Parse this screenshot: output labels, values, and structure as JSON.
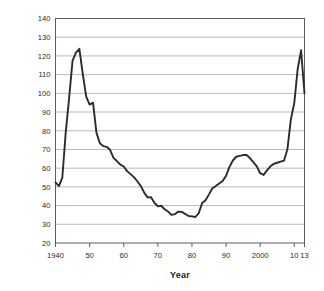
{
  "chart_data": {
    "type": "line",
    "title": "",
    "xlabel": "Year",
    "ylabel": "Federal debt as percentage of GDP",
    "xlim": [
      1940,
      2013
    ],
    "ylim": [
      20,
      140
    ],
    "grid": true,
    "legend": "none",
    "y_ticks": [
      140,
      130,
      120,
      110,
      100,
      90,
      80,
      70,
      60,
      50,
      40,
      30,
      20
    ],
    "y_tick_labels": [
      "140",
      "130",
      "120",
      "110",
      "100",
      "90",
      "80",
      "70",
      "60",
      "50",
      "40",
      "30",
      "20"
    ],
    "x_ticks": [
      1940,
      1950,
      1960,
      1970,
      1980,
      1990,
      2000,
      2010,
      2013
    ],
    "x_tick_labels": [
      "1940",
      "50",
      "60",
      "70",
      "80",
      "90",
      "2000",
      "10",
      "13"
    ],
    "line_color": "#2b2b2b",
    "grid_color": "#8c8c8c",
    "axis_color": "#4d4d4d",
    "series": [
      {
        "name": "Federal debt held as percentage of GDP",
        "x": [
          1940,
          1941,
          1942,
          1943,
          1944,
          1945,
          1946,
          1947,
          1948,
          1949,
          1950,
          1951,
          1952,
          1953,
          1954,
          1955,
          1956,
          1957,
          1958,
          1959,
          1960,
          1961,
          1962,
          1963,
          1964,
          1965,
          1966,
          1967,
          1968,
          1969,
          1970,
          1971,
          1972,
          1973,
          1974,
          1975,
          1976,
          1977,
          1978,
          1979,
          1980,
          1981,
          1982,
          1983,
          1984,
          1985,
          1986,
          1987,
          1988,
          1989,
          1990,
          1991,
          1992,
          1993,
          1994,
          1995,
          1996,
          1997,
          1998,
          1999,
          2000,
          2001,
          2002,
          2003,
          2004,
          2005,
          2006,
          2007,
          2008,
          2009,
          2010,
          2011,
          2012,
          2013
        ],
        "values": [
          52.4,
          50.4,
          54.9,
          79.1,
          97.6,
          117.5,
          121.7,
          123.8,
          110.3,
          98.2,
          94.0,
          95.0,
          79.0,
          73.3,
          71.8,
          71.4,
          69.8,
          65.5,
          63.8,
          61.9,
          60.9,
          58.4,
          56.8,
          55.2,
          53.0,
          50.5,
          46.9,
          44.4,
          44.5,
          41.5,
          39.6,
          39.9,
          38.0,
          36.8,
          35.0,
          35.4,
          36.8,
          36.6,
          35.6,
          34.4,
          34.2,
          33.9,
          36.0,
          41.4,
          42.9,
          46.0,
          49.3,
          50.5,
          51.8,
          53.1,
          55.9,
          60.7,
          64.1,
          66.1,
          66.6,
          67.0,
          67.1,
          65.4,
          63.2,
          61.0,
          57.3,
          56.4,
          58.8,
          61.0,
          62.3,
          62.9,
          63.5,
          64.0,
          70.2,
          86.1,
          94.8,
          113.0,
          123.0,
          100.0
        ]
      }
    ],
    "annotations": []
  }
}
